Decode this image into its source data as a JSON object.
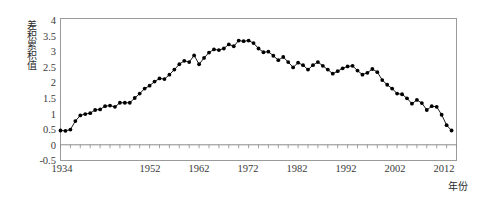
{
  "chart_data": {
    "type": "line",
    "title": "",
    "subtitle": "",
    "xlabel": "年份",
    "ylabel": "差积累积值",
    "xlim": [
      1934,
      2014
    ],
    "ylim": [
      -0.5,
      4
    ],
    "ytick_values": [
      4,
      3.5,
      3,
      2.5,
      2,
      1.5,
      1,
      0.5,
      0,
      -0.5
    ],
    "ytick_labels": [
      "4",
      "3.5",
      "3",
      "2.5",
      "2",
      "1.5",
      "1",
      "0.5",
      "0",
      "-0.5"
    ],
    "xtick_values": [
      1934,
      1952,
      1962,
      1972,
      1982,
      1992,
      2002,
      2012
    ],
    "xtick_labels": [
      "1934",
      "1952",
      "1962",
      "1972",
      "1982",
      "1992",
      "2002",
      "2012"
    ],
    "minor_xtick_interval": 2,
    "grid": false,
    "legend": null,
    "marker": "filled-circle",
    "line_color": "#000000",
    "marker_color": "#000000",
    "axis_color": "#808080",
    "zero_line": 0,
    "series": [
      {
        "name": "差积累积值",
        "x": [
          1934,
          1935,
          1936,
          1937,
          1938,
          1939,
          1940,
          1941,
          1942,
          1943,
          1944,
          1945,
          1946,
          1947,
          1948,
          1949,
          1950,
          1951,
          1952,
          1953,
          1954,
          1955,
          1956,
          1957,
          1958,
          1959,
          1960,
          1961,
          1962,
          1963,
          1964,
          1965,
          1966,
          1967,
          1968,
          1969,
          1970,
          1971,
          1972,
          1973,
          1974,
          1975,
          1976,
          1977,
          1978,
          1979,
          1980,
          1981,
          1982,
          1983,
          1984,
          1985,
          1986,
          1987,
          1988,
          1989,
          1990,
          1991,
          1992,
          1993,
          1994,
          1995,
          1996,
          1997,
          1998,
          1999,
          2000,
          2001,
          2002,
          2003,
          2004,
          2005,
          2006,
          2007,
          2008,
          2009,
          2010,
          2011,
          2012,
          2013
        ],
        "values": [
          0.45,
          0.44,
          0.48,
          0.75,
          0.93,
          0.97,
          1.0,
          1.1,
          1.12,
          1.22,
          1.24,
          1.2,
          1.33,
          1.33,
          1.33,
          1.48,
          1.62,
          1.78,
          1.87,
          2.0,
          2.1,
          2.08,
          2.22,
          2.38,
          2.55,
          2.66,
          2.62,
          2.83,
          2.55,
          2.75,
          2.92,
          3.02,
          3.0,
          3.05,
          3.18,
          3.12,
          3.3,
          3.28,
          3.3,
          3.22,
          3.05,
          2.93,
          2.95,
          2.82,
          2.68,
          2.78,
          2.62,
          2.45,
          2.6,
          2.52,
          2.38,
          2.52,
          2.62,
          2.5,
          2.38,
          2.25,
          2.33,
          2.42,
          2.48,
          2.5,
          2.35,
          2.22,
          2.28,
          2.4,
          2.3,
          2.05,
          1.9,
          1.78,
          1.62,
          1.6,
          1.47,
          1.3,
          1.42,
          1.32,
          1.1,
          1.22,
          1.2,
          0.95,
          0.62,
          0.45
        ]
      }
    ]
  },
  "axis": {
    "xlabel_text": "年份",
    "ylabel_text": "差积累积值"
  }
}
